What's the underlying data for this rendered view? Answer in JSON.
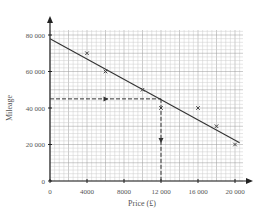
{
  "chart_data": {
    "type": "scatter",
    "title": "",
    "xlabel": "Price (£)",
    "ylabel": "Mileage",
    "xlim": [
      0,
      20000
    ],
    "ylim": [
      0,
      80000
    ],
    "x_ticks": [
      0,
      4000,
      8000,
      12000,
      16000,
      20000
    ],
    "x_tick_labels": [
      "0",
      "4000",
      "8000",
      "12 000",
      "16 000",
      "20 000"
    ],
    "y_ticks": [
      0,
      20000,
      40000,
      60000,
      80000
    ],
    "y_tick_labels": [
      "0",
      "20 000",
      "40 000",
      "60 000",
      "80 000"
    ],
    "grid": true,
    "legend": null,
    "series": [
      {
        "name": "cars",
        "marker": "x",
        "points": [
          {
            "x": 4000,
            "y": 70000
          },
          {
            "x": 6000,
            "y": 60000
          },
          {
            "x": 10000,
            "y": 50000
          },
          {
            "x": 12000,
            "y": 40000
          },
          {
            "x": 16000,
            "y": 40000
          },
          {
            "x": 18000,
            "y": 30000
          },
          {
            "x": 20000,
            "y": 20000
          }
        ]
      }
    ],
    "line_of_best_fit": {
      "x1": 0,
      "y1": 78000,
      "x2": 20500,
      "y2": 21000
    },
    "annotations": [
      {
        "type": "dashed-arrow",
        "description": "horizontal reading from mileage 45000 to line",
        "from": {
          "x": 0,
          "y": 45000
        },
        "to": {
          "x": 12000,
          "y": 45000
        }
      },
      {
        "type": "dashed-arrow",
        "description": "vertical reading from line down to price 12000",
        "from": {
          "x": 12000,
          "y": 45000
        },
        "to": {
          "x": 12000,
          "y": 0
        }
      }
    ]
  }
}
